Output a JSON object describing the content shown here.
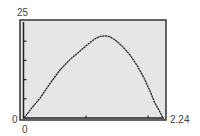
{
  "chart_data": {
    "type": "line",
    "title": "",
    "xlabel": "",
    "ylabel": "",
    "xlim": [
      0,
      2.24
    ],
    "ylim": [
      0,
      25
    ],
    "labels": {
      "ymax": "25",
      "ymin": "0",
      "xmin": "0",
      "xmax": "2.24"
    },
    "x_ticks": [
      1,
      2
    ],
    "y_ticks": [
      5,
      10,
      15,
      20
    ],
    "grid": false,
    "legend": null,
    "series": [
      {
        "name": "curve",
        "x": [
          0,
          0.13,
          0.26,
          0.42,
          0.58,
          0.74,
          0.9,
          1.02,
          1.14,
          1.22,
          1.29,
          1.38,
          1.47,
          1.59,
          1.71,
          1.83,
          1.95,
          2.03,
          2.11,
          2.18,
          2.24
        ],
        "y": [
          0,
          2.7,
          5.2,
          9.0,
          12.5,
          15.2,
          17.4,
          19.1,
          20.6,
          21.2,
          21.4,
          21.2,
          20.3,
          18.6,
          16.4,
          13.5,
          9.9,
          7.0,
          3.9,
          1.9,
          0
        ]
      }
    ]
  },
  "colors": {
    "background": "#ffffff",
    "plot_area": "#e6e6e6",
    "frame": "#333333",
    "curve": "#222222"
  }
}
